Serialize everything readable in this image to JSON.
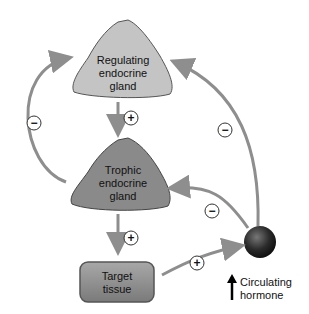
{
  "nodes": {
    "regulating": {
      "line1": "Regulating",
      "line2": "endocrine",
      "line3": "gland"
    },
    "trophic": {
      "line1": "Trophic",
      "line2": "endocrine",
      "line3": "gland"
    },
    "target": {
      "line1": "Target",
      "line2": "tissue"
    },
    "hormone": {
      "line1": "Circulating",
      "line2": "hormone",
      "icon": "up-arrow-icon"
    }
  },
  "signs": {
    "reg_to_trophic": "+",
    "trophic_to_target": "+",
    "target_to_hormone": "+",
    "trophic_to_reg": "−",
    "hormone_to_reg": "−",
    "hormone_to_trophic": "−"
  },
  "colors": {
    "regulating_fill": "#c4c4c4",
    "trophic_fill": "#8a8a8a",
    "target_fill": "#8c8c8c",
    "arrow": "#8e8e8e",
    "hormone_ball": "#2a2a2a"
  }
}
